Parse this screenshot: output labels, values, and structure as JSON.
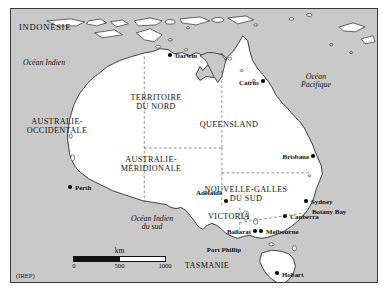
{
  "figure": {
    "credit": "(IREP)",
    "background_color": "#ffffff",
    "ocean_color": "#c9c9c9",
    "land_color": "#ffffff",
    "frame_color": "#3a3a3a",
    "boundary_style": "dashed"
  },
  "countries": [
    {
      "name": "indonesie",
      "label": "INDONÉSIE",
      "x": 18,
      "y": 22
    }
  ],
  "oceans": [
    {
      "name": "ocean-indien",
      "label": "Océan Indien",
      "lines": [
        "Océan Indien"
      ],
      "x": 22,
      "y": 58
    },
    {
      "name": "ocean-pacifique",
      "label": "Océan Pacifique",
      "lines": [
        "Océan",
        "Pacifique"
      ],
      "x": 300,
      "y": 72
    },
    {
      "name": "ocean-indien-du-sud",
      "label": "Océan Indien du sud",
      "lines": [
        "Océan Indien",
        "du sud"
      ],
      "x": 130,
      "y": 214
    }
  ],
  "regions": [
    {
      "name": "australie-occidentale",
      "lines": [
        "AUSTRALIE-",
        "OCCIDENTALE"
      ],
      "x": 56,
      "y": 117
    },
    {
      "name": "territoire-du-nord",
      "lines": [
        "TERRITOIRE",
        "DU NORD",
        ""
      ],
      "x": 155,
      "y": 93
    },
    {
      "name": "queensland",
      "lines": [
        "QUEENSLAND"
      ],
      "x": 228,
      "y": 120
    },
    {
      "name": "australie-meridionale",
      "lines": [
        "AUSTRALIE-",
        "MÉRIDIONALE"
      ],
      "x": 150,
      "y": 155
    },
    {
      "name": "nouvelle-galles-du-sud",
      "lines": [
        "NOUVELLE-GALLES",
        "DU SUD"
      ],
      "x": 245,
      "y": 185
    },
    {
      "name": "victoria",
      "lines": [
        "VICTORIA"
      ],
      "x": 228,
      "y": 212
    },
    {
      "name": "tasmanie",
      "lines": [
        "TASMANIE"
      ],
      "x": 206,
      "y": 261
    }
  ],
  "cities": [
    {
      "name": "darwin",
      "label": "Darwin",
      "dot_x": 169,
      "dot_y": 54,
      "label_x": 174,
      "label_y": 51,
      "align": "left"
    },
    {
      "name": "cairns",
      "label": "Cairns",
      "dot_x": 262,
      "dot_y": 80,
      "label_x": 258,
      "label_y": 78,
      "align": "right"
    },
    {
      "name": "brisbane",
      "label": "Brisbane",
      "dot_x": 312,
      "dot_y": 155,
      "label_x": 308,
      "label_y": 152,
      "align": "right"
    },
    {
      "name": "perth",
      "label": "Perth",
      "dot_x": 69,
      "dot_y": 186,
      "label_x": 74,
      "label_y": 183,
      "align": "left"
    },
    {
      "name": "adelaide",
      "label": "Adélaide",
      "dot_x": 225,
      "dot_y": 200,
      "label_x": 221,
      "label_y": 188,
      "align": "right"
    },
    {
      "name": "sydney",
      "label": "Sydney",
      "dot_x": 305,
      "dot_y": 200,
      "label_x": 310,
      "label_y": 197,
      "align": "left"
    },
    {
      "name": "canberra",
      "label": "Canberra",
      "dot_x": 284,
      "dot_y": 215,
      "label_x": 289,
      "label_y": 212,
      "align": "left"
    },
    {
      "name": "melbourne",
      "label": "Melbourne",
      "dot_x": 260,
      "dot_y": 230,
      "label_x": 265,
      "label_y": 227,
      "align": "left"
    },
    {
      "name": "ballarat",
      "label": "Ballarat",
      "dot_x": 254,
      "dot_y": 230,
      "label_x": 250,
      "label_y": 227,
      "align": "right"
    },
    {
      "name": "hobart",
      "label": "Hobart",
      "dot_x": 276,
      "dot_y": 272,
      "label_x": 281,
      "label_y": 270,
      "align": "left"
    }
  ],
  "places": [
    {
      "name": "botany-bay",
      "label": "Botany Bay",
      "x": 311,
      "y": 207,
      "align": "left"
    },
    {
      "name": "port-phillip",
      "label": "Port Phillip",
      "x": 240,
      "y": 245,
      "align": "right"
    }
  ],
  "scalebar": {
    "unit": "km",
    "ticks": [
      "0",
      "500",
      "1000"
    ],
    "min": 0,
    "max": 1000
  }
}
